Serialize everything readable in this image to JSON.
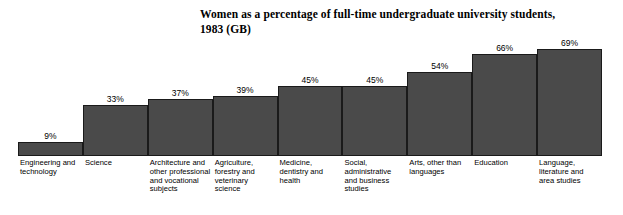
{
  "chart_data": {
    "type": "bar",
    "title": "Women as a percentage of full-time undergraduate university students, 1983 (GB)",
    "title_lines": [
      "Women as a percentage of full-time undergraduate university students,",
      "1983 (GB)"
    ],
    "xlabel": "",
    "ylabel": "",
    "ylim": [
      0,
      75
    ],
    "grid": false,
    "legend": "none",
    "bar_color": "#4a4a4a",
    "bar_border_color": "#1a1a1a",
    "value_suffix": "%",
    "categories": [
      "Engineering and technology",
      "Science",
      "Architecture and other professional and vocational subjects",
      "Agriculture, forestry and veterinary science",
      "Medicine, dentistry and health",
      "Social, administrative and business studies",
      "Arts, other than languages",
      "Education",
      "Language, literature and area studies"
    ],
    "values": [
      9,
      33,
      37,
      39,
      45,
      45,
      54,
      66,
      69
    ],
    "value_labels": [
      "9%",
      "33%",
      "37%",
      "39%",
      "45%",
      "45%",
      "54%",
      "66%",
      "69%"
    ]
  }
}
